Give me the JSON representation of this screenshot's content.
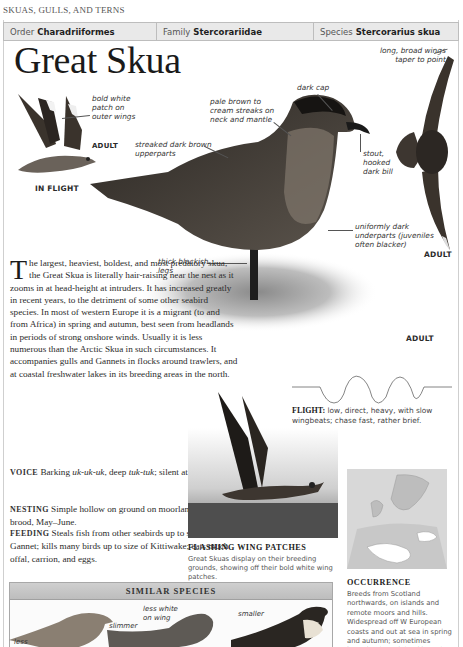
{
  "running_head": "SKUAS, GULLS, AND TERNS",
  "taxonomy": {
    "order_label": "Order",
    "order_value": "Charadriiformes",
    "family_label": "Family",
    "family_value": "Stercorariidae",
    "species_label": "Species",
    "species_value": "Stercorarius skua"
  },
  "title": "Great Skua",
  "callouts": {
    "bold_white_patch": [
      "bold white",
      "patch on",
      "outer wings"
    ],
    "dark_cap": "dark cap",
    "pale_streaks": [
      "pale brown to",
      "cream streaks on",
      "neck and mantle"
    ],
    "streaked_upperparts": [
      "streaked dark brown",
      "upperparts"
    ],
    "long_wings": [
      "long, broad wings",
      "taper to point"
    ],
    "stout_bill": [
      "stout,",
      "hooked",
      "dark bill"
    ],
    "dark_underparts": [
      "uniformly dark",
      "underparts (juveniles",
      "often blacker)"
    ],
    "thick_legs": [
      "thick blackish",
      "legs"
    ]
  },
  "labels": {
    "adult_flight_small": "ADULT",
    "in_flight": "IN FLIGHT",
    "adult_flying_right": "ADULT",
    "adult_standing": "ADULT"
  },
  "description": {
    "dropcap": "T",
    "intro": "he largest, heaviest, boldest, and most predatory skua, the Great Skua is literally hair-raising near the nest as it zooms in at head-height at intruders. It has increased greatly in recent years, to the detriment of some other seabird species. In most of western Europe it is a migrant (to and from Africa) in spring and autumn, best seen from headlands in periods of strong onshore winds. Usually it is less numerous than the Arctic Skua in such circumstances. It accompanies gulls and Gannets in flocks around trawlers, and at coastal freshwater lakes in its breeding areas in the north.",
    "voice_head": "VOICE",
    "voice_text_1": " Barking ",
    "voice_call_1": "uk-uk-uk",
    "voice_text_2": ", deep ",
    "voice_call_2": "tuk-tuk",
    "voice_text_3": "; silent at sea.",
    "nesting_head": "NESTING",
    "nesting_text": " Simple hollow on ground on moorland; 2 eggs; 1 brood, May–June.",
    "feeding_head": "FEEDING",
    "feeding_text": " Steals fish from other seabirds up to size of Gannet; kills many birds up to size of Kittiwake; eats much offal, carrion, and eggs."
  },
  "flight": {
    "head": "FLIGHT:",
    "text": " low, direct, heavy, with slow wingbeats; chase fast, rather brief."
  },
  "photo": {
    "caption_title": "FLASHING WING PATCHES",
    "caption_text": "Great Skuas display on their breeding grounds, showing off their bold white wing patches."
  },
  "occurrence": {
    "title": "OCCURRENCE",
    "text": "Breeds from Scotland northwards, on islands and remote moors and hills. Widespread off W European coasts and out at sea in spring and autumn; sometimes brought closer inland by gales and often"
  },
  "similar_species": {
    "header": "SIMILAR SPECIES",
    "callouts": {
      "less": "less",
      "slimmer": "slimmer",
      "less_white": [
        "less white",
        "on wing"
      ],
      "smaller": "smaller"
    }
  }
}
